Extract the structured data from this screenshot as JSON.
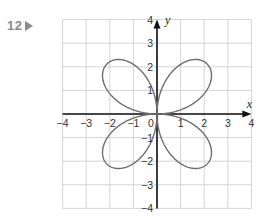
{
  "question": {
    "number": "12",
    "marker_icon": "triangle-right-icon"
  },
  "chart_data": {
    "type": "line",
    "title": "",
    "xlabel": "x",
    "ylabel": "y",
    "xlim": [
      -4,
      4
    ],
    "ylim": [
      -4,
      4
    ],
    "grid": true,
    "x_ticks": [
      "-4",
      "-3",
      "-2",
      "-1",
      "0",
      "1",
      "2",
      "3",
      "4"
    ],
    "y_ticks": [
      "4",
      "3",
      "2",
      "1",
      "-1",
      "-2",
      "-3",
      "-4"
    ],
    "series": [
      {
        "name": "four-petal rose curve",
        "description": "Four-leaved rose r = 3 sin(2θ), petals in each quadrant along the diagonals, max radius about 3",
        "petal_tips": [
          [
            2.1,
            2.1
          ],
          [
            -2.1,
            2.1
          ],
          [
            -2.1,
            -2.1
          ],
          [
            2.1,
            -2.1
          ]
        ],
        "passes_through_origin": true
      }
    ],
    "colors": {
      "curve": "#6e6e6e",
      "axes": "#111111",
      "grid": "#d4d4d4"
    }
  }
}
